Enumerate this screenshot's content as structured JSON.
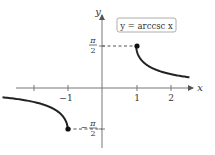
{
  "chart_data": {
    "type": "line",
    "title": "y = arccsc x",
    "xlabel": "x",
    "ylabel": "y",
    "x_ticks": [
      -2,
      -1,
      1,
      2
    ],
    "x_tick_labels": [
      "",
      "−1",
      "1",
      "2"
    ],
    "y_tick_labels": [
      "π/2",
      "−π/2"
    ],
    "xlim": [
      -2.5,
      2.6
    ],
    "ylim": [
      -2.2,
      2.2
    ],
    "series": [
      {
        "name": "arccsc x (x ≥ 1)",
        "x": [
          1,
          1.05,
          1.1,
          1.2,
          1.3,
          1.5,
          1.75,
          2,
          2.25,
          2.5
        ],
        "y": [
          1.5708,
          1.261,
          1.1411,
          0.9851,
          0.8776,
          0.7297,
          0.6082,
          0.5236,
          0.4611,
          0.4115
        ]
      },
      {
        "name": "arccsc x (x ≤ −1)",
        "x": [
          -2.5,
          -2.25,
          -2,
          -1.75,
          -1.5,
          -1.3,
          -1.2,
          -1.1,
          -1.05,
          -1
        ],
        "y": [
          -0.4115,
          -0.4611,
          -0.5236,
          -0.6082,
          -0.7297,
          -0.8776,
          -0.9851,
          -1.1411,
          -1.261,
          -1.5708
        ]
      }
    ],
    "annotations": [
      {
        "type": "point",
        "x": 1,
        "y": 1.5708,
        "filled": true
      },
      {
        "type": "point",
        "x": -1,
        "y": -1.5708,
        "filled": true
      },
      {
        "type": "dashed-line",
        "from": [
          0,
          1.5708
        ],
        "to": [
          1,
          1.5708
        ]
      },
      {
        "type": "dashed-line",
        "from": [
          -1,
          -1.5708
        ],
        "to": [
          0,
          -1.5708
        ]
      }
    ],
    "grid": false,
    "legend": {
      "position": "top-right-boxed",
      "text": "y = arccsc x"
    }
  },
  "labels": {
    "equation": "y = arccsc x",
    "x_axis": "x",
    "y_axis": "y",
    "tick_neg1": "−1",
    "tick_1": "1",
    "tick_2": "2",
    "pi": "π",
    "two": "2",
    "minus": "−"
  }
}
